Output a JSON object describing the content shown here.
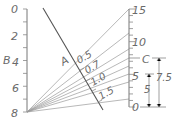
{
  "diagram": {
    "type": "nomograph",
    "scale_B": {
      "label": "B",
      "ticks": [
        "0",
        "2",
        "4",
        "6",
        "8"
      ],
      "min": 0,
      "max": 8
    },
    "scale_A": {
      "label": "A",
      "ticks": [
        "0.5",
        "0.7",
        "1.0",
        "1.5"
      ]
    },
    "scale_C": {
      "label": "C",
      "ticks": [
        "0",
        "5",
        "10",
        "15"
      ],
      "min": 0,
      "max": 15
    },
    "dimensions": {
      "short": "5",
      "long": "7.5"
    },
    "colors": {
      "line": "#777777",
      "text": "#6a6a6a"
    }
  }
}
